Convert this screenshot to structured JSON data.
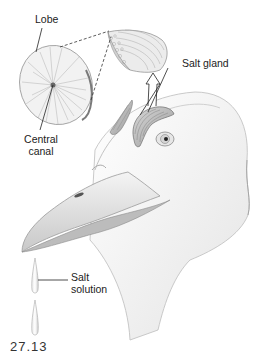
{
  "figure": {
    "figure_number_fragment": "27.13"
  },
  "labels": {
    "lobe": "Lobe",
    "central_canal_line1": "Central",
    "central_canal_line2": "canal",
    "salt_gland": "Salt gland",
    "salt_solution_line1": "Salt",
    "salt_solution_line2": "solution"
  },
  "colors": {
    "background": "#ffffff",
    "line": "#222222",
    "tissue_light": "#e6e6e6",
    "tissue_mid": "#bdbdbd",
    "tissue_dark": "#8a8a8a",
    "head_fill": "#f7f7f7"
  }
}
